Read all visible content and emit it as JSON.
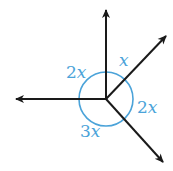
{
  "diagram": {
    "type": "angles-around-a-point",
    "colors": {
      "rays": "#1a1a1a",
      "angle_marks": "#4ba3d9"
    },
    "center": [
      106,
      99
    ],
    "rays": [
      {
        "name": "up",
        "tip": [
          106,
          8
        ]
      },
      {
        "name": "up-right",
        "tip": [
          168,
          34
        ]
      },
      {
        "name": "down-right",
        "tip": [
          165,
          164
        ]
      },
      {
        "name": "left",
        "tip": [
          14,
          99
        ]
      }
    ],
    "angles": [
      {
        "between": "up and left",
        "label_num": "2",
        "label_var": "x"
      },
      {
        "between": "up and up-right",
        "label_num": "",
        "label_var": "x"
      },
      {
        "between": "up-right and down-right",
        "label_num": "2",
        "label_var": "x"
      },
      {
        "between": "down-right and left",
        "label_num": "3",
        "label_var": "x"
      }
    ]
  }
}
